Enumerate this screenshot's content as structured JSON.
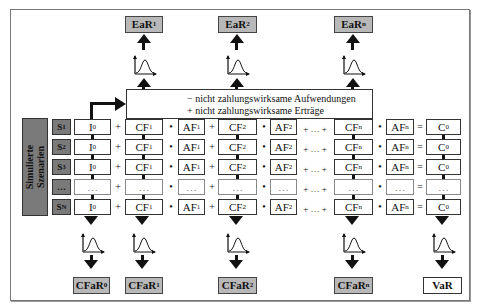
{
  "diagram": {
    "side_label": [
      "Simulierte",
      "Szenarien"
    ],
    "scenarios": [
      "S1",
      "S2",
      "S3",
      "...",
      "SN"
    ],
    "top_outputs": [
      "EaR1",
      "EaR2",
      "EaRn"
    ],
    "bottom_outputs": [
      "CFaR0",
      "CFaR1",
      "CFaR2",
      "CFaRn",
      "VaR"
    ],
    "adjustments": {
      "line1": "−  nicht zahlungswirksame Aufwendungen",
      "line2": "+  nicht zahlungswirksame Erträge"
    },
    "equation_terms": [
      "I0",
      "CF1",
      "AF1",
      "CF2",
      "AF2",
      "CFn",
      "AFn",
      "C0"
    ],
    "operators": [
      "+",
      "•",
      "+",
      "•",
      "+ … +",
      "•",
      "="
    ],
    "ellipsis": "…"
  }
}
